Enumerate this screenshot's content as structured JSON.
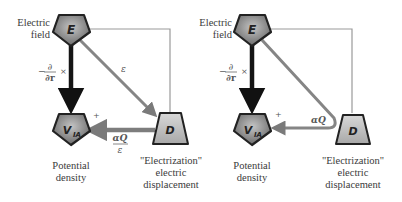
{
  "diagrams": [
    {
      "id": "left",
      "nodes": {
        "E": {
          "symbol": "E",
          "label_line1": "Electric",
          "label_line2": "field"
        },
        "V": {
          "symbol": "V",
          "subscript": "IA",
          "label_line1": "Potential",
          "label_line2": "density"
        },
        "D": {
          "symbol": "D",
          "label_line1": "\"Electrization\"",
          "label_line2": "electric",
          "label_line3": "displacement"
        }
      },
      "edges": {
        "E_to_V": {
          "label_prefix": "−",
          "label_num": "∂",
          "label_den": "∂r",
          "label_suffix": "×"
        },
        "E_to_D": {
          "label": "ε"
        },
        "D_to_V": {
          "label_num": "αQ",
          "label_den": "ε",
          "sign": "+"
        }
      }
    },
    {
      "id": "right",
      "nodes": {
        "E": {
          "symbol": "E",
          "label_line1": "Electric",
          "label_line2": "field"
        },
        "V": {
          "symbol": "V",
          "subscript": "IA",
          "label_line1": "Potential",
          "label_line2": "density"
        },
        "D": {
          "symbol": "D",
          "label_line1": "\"Electrization\"",
          "label_line2": "electric",
          "label_line3": "displacement"
        }
      },
      "edges": {
        "E_to_V": {
          "label_prefix": "−",
          "label_num": "∂",
          "label_den": "∂r",
          "label_suffix": "×"
        },
        "E_via_D_to_V": {
          "label": "αQ",
          "sign": "+"
        }
      }
    }
  ],
  "colors": {
    "node_fill_dark": "#6e6e6e",
    "node_fill_light": "#bdbdbd",
    "arrow_dark": "#1a1a1a",
    "arrow_gray": "#8a8a8a",
    "frame_line": "#9a9a9a"
  }
}
